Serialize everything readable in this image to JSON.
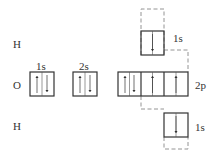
{
  "diagram": {
    "atoms": [
      {
        "symbol": "H",
        "position": "top"
      },
      {
        "symbol": "O",
        "position": "middle"
      },
      {
        "symbol": "H",
        "position": "bottom"
      }
    ],
    "oxygen_orbitals": [
      {
        "label": "1s",
        "electrons": [
          "up",
          "down"
        ]
      },
      {
        "label": "2s",
        "electrons": [
          "up",
          "down"
        ]
      },
      {
        "label": "2p",
        "boxes": [
          [
            "up",
            "down"
          ],
          [
            "up"
          ],
          [
            "up"
          ]
        ]
      }
    ],
    "hydrogen_orbitals": [
      {
        "atom": "top H",
        "label": "1s",
        "electrons": [
          "down"
        ],
        "overlaps_with": "2p box 2"
      },
      {
        "atom": "bottom H",
        "label": "1s",
        "electrons": [
          "down"
        ],
        "overlaps_with": "2p box 3"
      }
    ]
  }
}
